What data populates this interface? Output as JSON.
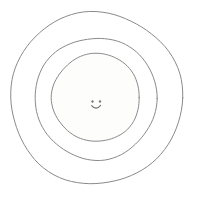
{
  "canvas": {
    "width": 198,
    "height": 214,
    "background_color": "#ffffff",
    "title": "Concentric circles with smiley face at center"
  },
  "style": {
    "stroke_color": "#8a8a8a",
    "stroke_color_soft": "#9a9a9a",
    "face_stroke_color": "#6f6f6f",
    "inner_fill_color": "#fdfdfc",
    "middle_fill_color": "#ffffff",
    "outer_fill_color": "#ffffff",
    "stroke_width": 1
  },
  "diagram": {
    "type": "concentric-circles",
    "center": {
      "x": 96,
      "y": 98
    },
    "rings": [
      {
        "name": "outer-ring",
        "index": 1,
        "radius": 86,
        "cx": 96,
        "cy": 98,
        "label": "",
        "fill": "#ffffff",
        "stroke": "#8a8a8a"
      },
      {
        "name": "middle-ring",
        "index": 2,
        "radius": 61,
        "cx": 96,
        "cy": 98.5,
        "label": "",
        "fill": "#ffffff",
        "stroke": "#8a8a8a"
      },
      {
        "name": "inner-ring",
        "index": 3,
        "radius": 44,
        "cx": 96,
        "cy": 97.5,
        "label": "",
        "fill": "#fdfdfc",
        "stroke": "#8a8a8a"
      }
    ],
    "face": {
      "name": "smiley-face",
      "center": {
        "x": 96,
        "y": 104
      },
      "expression": "smiling",
      "eyes": [
        {
          "name": "left-eye",
          "cx": 92.5,
          "cy": 101.5,
          "r": 0.9
        },
        {
          "name": "right-eye",
          "cx": 100.0,
          "cy": 101.5,
          "r": 0.9
        }
      ],
      "mouth": {
        "name": "smile-mouth",
        "path": "M 91.6 105.6 Q 96.1 110.8 100.6 105.4",
        "stroke": "#6f6f6f",
        "stroke_width": 1.1
      }
    }
  }
}
